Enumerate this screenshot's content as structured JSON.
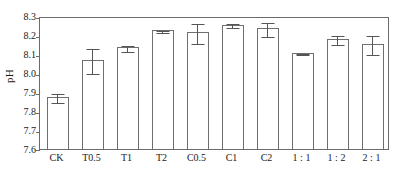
{
  "chart_data": {
    "type": "bar",
    "title": "",
    "xlabel": "",
    "ylabel": "pH",
    "ylim": [
      7.6,
      8.3
    ],
    "yticks": [
      "7.6",
      "7.7",
      "7.8",
      "7.9",
      "8.0",
      "8.1",
      "8.2",
      "8.3"
    ],
    "ytick_values": [
      7.6,
      7.7,
      7.8,
      7.9,
      8.0,
      8.1,
      8.2,
      8.3
    ],
    "grid": false,
    "legend": "none",
    "categories": [
      "CK",
      "T0.5",
      "T1",
      "T2",
      "C0.5",
      "C1",
      "C2",
      "1 : 1",
      "1 : 2",
      "2 : 1"
    ],
    "values": [
      7.875,
      8.068,
      8.135,
      8.225,
      8.215,
      8.255,
      8.235,
      8.105,
      8.178,
      8.152
    ],
    "errors": [
      0.025,
      0.068,
      0.017,
      0.008,
      0.055,
      0.012,
      0.04,
      0.005,
      0.027,
      0.052
    ],
    "series": [
      {
        "name": "pH",
        "values": [
          7.875,
          8.068,
          8.135,
          8.225,
          8.215,
          8.255,
          8.235,
          8.105,
          8.178,
          8.152
        ],
        "errors": [
          0.025,
          0.068,
          0.017,
          0.008,
          0.055,
          0.012,
          0.04,
          0.005,
          0.027,
          0.052
        ]
      }
    ],
    "bar_facecolor": "#ffffff",
    "bar_edgecolor": "#6f6f6f",
    "errorbar_color": "#555555",
    "axis_color": "#6b6b6b"
  }
}
